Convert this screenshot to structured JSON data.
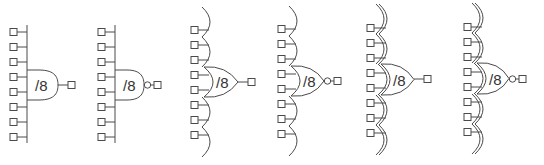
{
  "diagram": {
    "title": "",
    "stroke_color": "#4a4a4a",
    "label_color": "#333333",
    "gates": [
      {
        "type": "and",
        "label": "/8",
        "inputs": 8,
        "negated": false,
        "x": 27,
        "y_top": 25,
        "y_bottom": 143,
        "in_first": 32,
        "in_step": 15,
        "body_top": 70,
        "body_bottom": 100,
        "body_right": 58,
        "out_y": 85,
        "sq_x": 10
      },
      {
        "type": "nand",
        "label": "/8",
        "inputs": 8,
        "negated": true,
        "x": 115,
        "y_top": 25,
        "y_bottom": 143,
        "in_first": 32,
        "in_step": 15,
        "body_top": 70,
        "body_bottom": 100,
        "body_right": 144,
        "out_y": 85,
        "sq_x": 98
      },
      {
        "type": "or",
        "label": "/8",
        "inputs": 8,
        "negated": false,
        "x": 204,
        "y_top": 7,
        "y_bottom": 157,
        "in_first": 30,
        "in_step": 15,
        "body_top": 67,
        "body_bottom": 97,
        "body_right": 238,
        "out_y": 82,
        "sq_x": 191
      },
      {
        "type": "nor",
        "label": "/8",
        "inputs": 8,
        "negated": true,
        "x": 291,
        "y_top": 6,
        "y_bottom": 156,
        "in_first": 29,
        "in_step": 15,
        "body_top": 66,
        "body_bottom": 96,
        "body_right": 324,
        "out_y": 81,
        "sq_x": 278
      },
      {
        "type": "xor",
        "label": "/8",
        "inputs": 8,
        "negated": false,
        "x": 381,
        "y_top": 4,
        "y_bottom": 155,
        "in_first": 28,
        "in_step": 15,
        "body_top": 64,
        "body_bottom": 95,
        "body_right": 414,
        "out_y": 79,
        "sq_x": 367
      },
      {
        "type": "xnor",
        "label": "/8",
        "inputs": 8,
        "negated": true,
        "x": 477,
        "y_top": 3,
        "y_bottom": 154,
        "in_first": 27,
        "in_step": 15,
        "body_top": 63,
        "body_bottom": 94,
        "body_right": 509,
        "out_y": 79,
        "sq_x": 464
      }
    ]
  }
}
